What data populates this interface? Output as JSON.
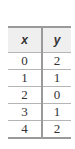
{
  "table": {
    "headers": [
      "x",
      "y"
    ],
    "rows": [
      [
        "0",
        "2"
      ],
      [
        "1",
        "1"
      ],
      [
        "2",
        "0"
      ],
      [
        "3",
        "1"
      ],
      [
        "4",
        "2"
      ]
    ]
  }
}
